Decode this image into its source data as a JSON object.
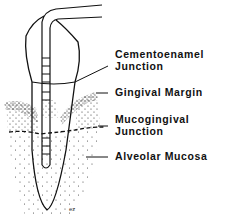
{
  "diagram": {
    "labels": [
      {
        "id": "cej",
        "line1": "Cementoenamel",
        "line2": "Junction"
      },
      {
        "id": "gingival-margin",
        "line1": "Gingival Margin",
        "line2": ""
      },
      {
        "id": "mucogingival-junction",
        "line1": "Mucogingival",
        "line2": "Junction"
      },
      {
        "id": "alveolar-mucosa",
        "line1": "Alveolar Mucosa",
        "line2": ""
      }
    ],
    "signature": "ez",
    "colors": {
      "ink": "#111111",
      "background": "#ffffff"
    }
  }
}
